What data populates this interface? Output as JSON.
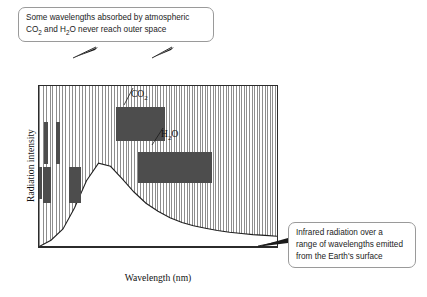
{
  "figure": {
    "type": "spectrum-diagram",
    "title_visible": false
  },
  "callouts": {
    "top": {
      "line1": "Some wavelengths absorbed by atmospheric",
      "line2_pre": "CO",
      "line2_sub1": "2",
      "line2_mid": " and H",
      "line2_sub2": "2",
      "line2_post": "O never reach outer space"
    },
    "right": {
      "line1": "Infrared radiation over a",
      "line2": "range of wavelengths emitted",
      "line3": "from the Earth's surface"
    }
  },
  "gas_labels": {
    "co2": {
      "text": "CO",
      "sub": "2"
    },
    "h2o_pre": "H",
    "h2o_sub": "2",
    "h2o_post": "O"
  },
  "axes": {
    "x_title": "Wavelength (nm)",
    "y_title": "Radiation intensity",
    "x_ticks": [
      {
        "value": 10000,
        "label": "10 000"
      },
      {
        "value": 20000,
        "label": "20 000"
      },
      {
        "value": 30000,
        "label": "30 000"
      }
    ],
    "x_range": [
      0,
      43600
    ],
    "y_range_labeled": false
  },
  "colors": {
    "absorption_band": "#4d4d4d",
    "hatch_line": "#8d8d8d",
    "axis": "#2b2b2b",
    "callout_border": "#9a9a9a",
    "background": "#ffffff"
  },
  "chart_data": {
    "type": "area",
    "title": "",
    "xlabel": "Wavelength (nm)",
    "ylabel": "Radiation intensity",
    "xlim": [
      0,
      43600
    ],
    "ylim": [
      0,
      1
    ],
    "grid": false,
    "legend": false,
    "emission_curve": {
      "name": "Earth surface infrared emission",
      "x": [
        0,
        2200,
        4400,
        6500,
        8700,
        10900,
        13100,
        15300,
        17400,
        19600,
        21800,
        24000,
        26200,
        28300,
        30500,
        32700,
        34900,
        37100,
        39200,
        41400,
        43600
      ],
      "y": [
        0.0,
        0.04,
        0.11,
        0.24,
        0.41,
        0.52,
        0.5,
        0.42,
        0.34,
        0.27,
        0.22,
        0.18,
        0.15,
        0.13,
        0.115,
        0.1,
        0.09,
        0.082,
        0.075,
        0.07,
        0.065
      ]
    },
    "absorption_bands": [
      {
        "gas": "",
        "x_start": 900,
        "x_end": 1600,
        "y_bottom": 0.52,
        "y_top": 0.78
      },
      {
        "gas": "",
        "x_start": 3100,
        "x_end": 3800,
        "y_bottom": 0.52,
        "y_top": 0.78
      },
      {
        "gas": "",
        "x_start": 0,
        "x_end": 600,
        "y_bottom": 0.3,
        "y_top": 0.5
      },
      {
        "gas": "",
        "x_start": 700,
        "x_end": 2200,
        "y_bottom": 0.28,
        "y_top": 0.5
      },
      {
        "gas": "",
        "x_start": 5400,
        "x_end": 7600,
        "y_bottom": 0.28,
        "y_top": 0.5
      },
      {
        "gas": "CO2",
        "x_start": 13900,
        "x_end": 22900,
        "y_bottom": 0.66,
        "y_top": 0.87
      },
      {
        "gas": "H2O",
        "x_start": 17900,
        "x_end": 31500,
        "y_bottom": 0.4,
        "y_top": 0.59
      }
    ],
    "absorption_line_clusters": [
      {
        "x_start": 600,
        "x_end": 7100,
        "count": 4,
        "note": "sparse arrows left group"
      },
      {
        "x_start": 9800,
        "x_end": 13300,
        "count": 7,
        "note": "dense arrows mid-left group"
      },
      {
        "x_start": 24800,
        "x_end": 42900,
        "count": 24,
        "note": "dense arrows right group"
      }
    ],
    "braces": [
      {
        "x_start": 600,
        "x_end": 13300,
        "label_ref": "top-callout"
      },
      {
        "x_start": 15200,
        "x_end": 28800,
        "label_ref": "top-callout"
      }
    ]
  }
}
